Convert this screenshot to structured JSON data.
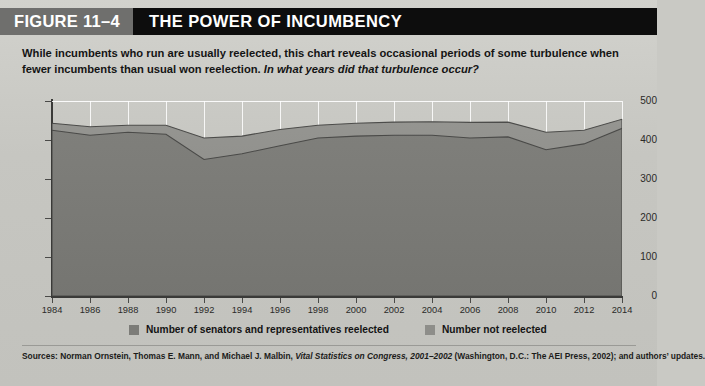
{
  "header": {
    "figure_tag": "FIGURE 11–4",
    "title": "THE POWER OF INCUMBENCY",
    "tag_bg": "#6f6f6d",
    "bar_bg": "#0d0d0d"
  },
  "caption": {
    "text_main": "While incumbents who run are usually reelected, this chart reveals occasional periods of some turbulence when fewer incumbents than usual won reelection. ",
    "text_question": "In what years did that turbulence occur?"
  },
  "legend": {
    "items": [
      {
        "label": "Number of senators and representatives reelected",
        "color": "#7c7c78"
      },
      {
        "label": "Number not reelected",
        "color": "#8e8e8a"
      }
    ]
  },
  "sources": {
    "prefix": "Sources: Norman Ornstein, Thomas E. Mann, and Michael J. Malbin, ",
    "italic_title": "Vital Statistics on Congress, 2001–2002",
    "suffix": " (Washington, D.C.: The AEI Press, 2002); and authors’ updates."
  },
  "chart_data": {
    "type": "area",
    "title": "THE POWER OF INCUMBENCY",
    "xlabel": "",
    "ylabel": "",
    "xlim": [
      1984,
      2014
    ],
    "ylim": [
      0,
      500
    ],
    "ytick_labels": [
      "0",
      "100",
      "200",
      "300",
      "400",
      "500"
    ],
    "ytick_values": [
      0,
      100,
      200,
      300,
      400,
      500
    ],
    "grid": true,
    "legend_position": "bottom",
    "stacked": true,
    "x": [
      1984,
      1986,
      1988,
      1990,
      1992,
      1994,
      1996,
      1998,
      2000,
      2002,
      2004,
      2006,
      2008,
      2010,
      2012,
      2014
    ],
    "xtick_labels": [
      "1984",
      "1986",
      "1988",
      "1990",
      "1992",
      "1994",
      "1996",
      "1998",
      "2000",
      "2002",
      "2004",
      "2006",
      "2008",
      "2010",
      "2012",
      "2014"
    ],
    "series": [
      {
        "name": "Number of senators and representatives reelected",
        "color": "#7c7c78",
        "values": [
          425,
          412,
          420,
          415,
          350,
          365,
          385,
          405,
          410,
          412,
          412,
          405,
          408,
          375,
          390,
          430
        ]
      },
      {
        "name": "Number not reelected",
        "color": "#8e8e8a",
        "values": [
          18,
          22,
          18,
          23,
          55,
          45,
          42,
          33,
          33,
          34,
          35,
          40,
          38,
          45,
          35,
          23
        ]
      }
    ],
    "totals": [
      443,
      434,
      438,
      438,
      405,
      410,
      427,
      438,
      443,
      446,
      447,
      445,
      446,
      420,
      425,
      453
    ]
  }
}
